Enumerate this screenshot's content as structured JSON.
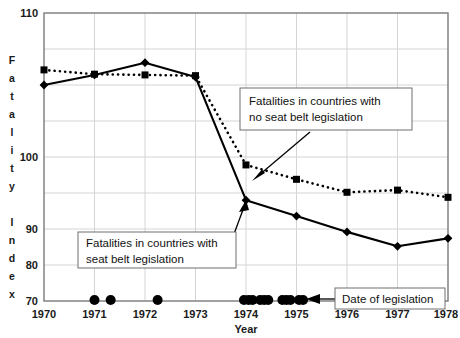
{
  "chart_data": {
    "type": "line",
    "title": "",
    "xlabel": "Year",
    "ylabel": "Fatality Index",
    "x": [
      1970,
      1971,
      1972,
      1973,
      1974,
      1975,
      1976,
      1977,
      1978
    ],
    "xlim": [
      1970,
      1978
    ],
    "ylim": [
      70,
      110
    ],
    "yticks": [
      70,
      80,
      90,
      100,
      110
    ],
    "xticks": [
      1970,
      1971,
      1972,
      1973,
      1974,
      1975,
      1976,
      1977,
      1978
    ],
    "grid": true,
    "legend_position": "annotations",
    "series": [
      {
        "name": "Fatalities in countries with seat belt legislation",
        "style": "solid",
        "marker": "diamond",
        "values": [
          100.0,
          101.4,
          103.1,
          101.1,
          84.0,
          81.8,
          79.6,
          77.6,
          78.7
        ]
      },
      {
        "name": "Fatalities in countries with no seat belt legislation",
        "style": "dotted",
        "marker": "square",
        "values": [
          102.1,
          101.5,
          101.4,
          101.3,
          88.9,
          86.9,
          85.1,
          85.4,
          84.4
        ]
      }
    ],
    "legislation_dates": {
      "name": "Date of legislation",
      "marker": "dot",
      "y": 70,
      "x": [
        1971.0,
        1971.32,
        1972.25,
        1973.96,
        1974.05,
        1974.13,
        1974.28,
        1974.36,
        1974.44,
        1974.72,
        1974.8,
        1974.88,
        1975.05,
        1975.13
      ]
    },
    "annotations": [
      {
        "id": "annot-no-legislation",
        "line1": "Fatalities in countries with",
        "line2": "no seat belt legislation",
        "points_to_series": "Fatalities in countries with no seat belt legislation"
      },
      {
        "id": "annot-legislation",
        "line1": "Fatalities in countries with",
        "line2": "seat belt legislation",
        "points_to_series": "Fatalities in countries with seat belt legislation"
      },
      {
        "id": "annot-date-legislation",
        "line1": "Date of legislation",
        "line2": "",
        "points_to_series": "legislation_dates"
      }
    ]
  },
  "axes": {
    "y_tick_labels": [
      "110",
      "100",
      "90",
      "80",
      "70"
    ],
    "x_tick_labels": [
      "1970",
      "1971",
      "1972",
      "1973",
      "1974",
      "1975",
      "1976",
      "1977",
      "1978"
    ],
    "x_axis_title": "Year",
    "y_axis_letters": [
      "F",
      "a",
      "t",
      "a",
      "l",
      "i",
      "t",
      "y",
      "",
      "I",
      "n",
      "d",
      "e",
      "x"
    ]
  },
  "colors": {
    "series_line": "#000000",
    "grid": "#d4d4d4",
    "frame": "#7a7a7a",
    "annotation_border": "#6f6f6f",
    "background": "#ffffff",
    "text": "#111111"
  }
}
